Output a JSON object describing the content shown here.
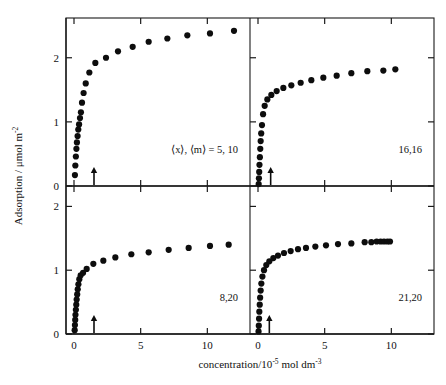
{
  "figure": {
    "axis_titles": {
      "x": "concentration/10",
      "x_exp": "-5",
      "x_tail": " mol dm",
      "x_tail_exp": "-3",
      "y": "Adsorption / μmol  m",
      "y_exp": "-2"
    },
    "x_ticks": [
      "0",
      "5",
      "10"
    ],
    "y_ticks": [
      "0",
      "1",
      "2"
    ],
    "colors": {
      "marker": "#0d0d0d",
      "axis": "#1a1a1a",
      "background": "#ffffff"
    }
  },
  "chart_data": [
    {
      "type": "scatter",
      "panel": "top-left",
      "label": "⟨x⟩, ⟨m⟩ = 5, 10",
      "title": "",
      "xlabel": "concentration/10-5 mol dm-3",
      "ylabel": "Adsorption / μmol m-2",
      "xlim": [
        -0.6,
        13.2
      ],
      "ylim": [
        0,
        2.62
      ],
      "grid": false,
      "cmc_arrow_x": 1.5,
      "x": [
        0.07,
        0.1,
        0.14,
        0.18,
        0.22,
        0.27,
        0.32,
        0.38,
        0.45,
        0.52,
        0.6,
        0.72,
        0.88,
        1.15,
        1.6,
        2.4,
        3.3,
        4.4,
        5.6,
        7.0,
        8.5,
        10.2,
        12.0
      ],
      "y": [
        0.17,
        0.32,
        0.46,
        0.58,
        0.68,
        0.78,
        0.88,
        0.96,
        1.06,
        1.15,
        1.3,
        1.45,
        1.6,
        1.77,
        1.92,
        2.0,
        2.1,
        2.17,
        2.25,
        2.3,
        2.35,
        2.38,
        2.42
      ]
    },
    {
      "type": "scatter",
      "panel": "top-right",
      "label": "16,16",
      "title": "",
      "xlim": [
        -0.6,
        13.2
      ],
      "ylim": [
        0,
        2.62
      ],
      "grid": false,
      "cmc_arrow_x": 0.95,
      "x": [
        0.05,
        0.07,
        0.09,
        0.11,
        0.14,
        0.17,
        0.2,
        0.24,
        0.3,
        0.38,
        0.5,
        0.7,
        1.0,
        1.4,
        1.9,
        2.5,
        3.2,
        4.0,
        4.9,
        5.9,
        7.0,
        8.2,
        9.4,
        10.3
      ],
      "y": [
        0.03,
        0.12,
        0.22,
        0.33,
        0.45,
        0.58,
        0.7,
        0.82,
        0.95,
        1.12,
        1.25,
        1.35,
        1.42,
        1.48,
        1.53,
        1.57,
        1.61,
        1.65,
        1.69,
        1.72,
        1.76,
        1.79,
        1.8,
        1.82
      ]
    },
    {
      "type": "scatter",
      "panel": "bottom-left",
      "label": "8,20",
      "title": "",
      "xlim": [
        -0.6,
        13.2
      ],
      "ylim": [
        0,
        2.32
      ],
      "grid": false,
      "cmc_arrow_x": 1.5,
      "x": [
        0.05,
        0.07,
        0.09,
        0.11,
        0.14,
        0.17,
        0.2,
        0.24,
        0.28,
        0.33,
        0.4,
        0.5,
        0.68,
        0.95,
        1.45,
        2.2,
        3.1,
        4.3,
        5.6,
        7.1,
        8.6,
        10.2,
        11.6
      ],
      "y": [
        0.06,
        0.14,
        0.22,
        0.3,
        0.38,
        0.46,
        0.54,
        0.62,
        0.7,
        0.78,
        0.86,
        0.92,
        0.96,
        1.02,
        1.1,
        1.15,
        1.2,
        1.25,
        1.28,
        1.32,
        1.35,
        1.38,
        1.4
      ]
    },
    {
      "type": "scatter",
      "panel": "bottom-right",
      "label": "21,20",
      "title": "",
      "xlim": [
        -0.6,
        13.2
      ],
      "ylim": [
        0,
        2.32
      ],
      "grid": false,
      "cmc_arrow_x": 0.85,
      "x": [
        0.04,
        0.06,
        0.08,
        0.1,
        0.13,
        0.16,
        0.2,
        0.25,
        0.33,
        0.45,
        0.62,
        0.85,
        1.15,
        1.5,
        1.95,
        2.45,
        3.0,
        3.6,
        4.3,
        5.1,
        6.0,
        7.0,
        8.0,
        8.5,
        8.9,
        9.2,
        9.45,
        9.7,
        9.9
      ],
      "y": [
        0.04,
        0.13,
        0.24,
        0.35,
        0.46,
        0.57,
        0.68,
        0.79,
        0.9,
        1.0,
        1.08,
        1.14,
        1.19,
        1.23,
        1.27,
        1.3,
        1.33,
        1.35,
        1.37,
        1.39,
        1.41,
        1.42,
        1.44,
        1.44,
        1.45,
        1.45,
        1.45,
        1.45,
        1.45
      ]
    }
  ]
}
